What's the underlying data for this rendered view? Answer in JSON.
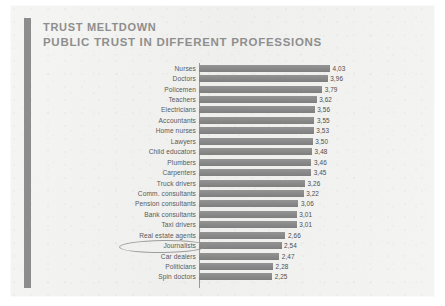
{
  "document": {
    "title_line1": "TRUST MELTDOWN",
    "title_line2": "PUBLIC TRUST IN DIFFERENT PROFESSIONS",
    "accent_color": "#8d8d8d",
    "bar_color": "#8b8b8b",
    "page_background": "#f2f2f0",
    "annotation": {
      "type": "hand-drawn-ellipse",
      "target": "Journalists",
      "color": "#8f8f8f"
    }
  },
  "chart_data": {
    "type": "bar",
    "orientation": "horizontal",
    "xlabel": "",
    "ylabel": "",
    "xlim": [
      0,
      4.03
    ],
    "grid": false,
    "legend": null,
    "decimal_separator": ",",
    "categories": [
      "Nurses",
      "Doctors",
      "Policemen",
      "Teachers",
      "Electricians",
      "Accountants",
      "Home nurses",
      "Lawyers",
      "Child educators",
      "Plumbers",
      "Carpenters",
      "Truck drivers",
      "Comm. consultants",
      "Pension consultants",
      "Bank consultants",
      "Taxi drivers",
      "Real estate agents",
      "Journalists",
      "Car dealers",
      "Politicians",
      "Spin doctors"
    ],
    "values": [
      4.03,
      3.96,
      3.79,
      3.62,
      3.56,
      3.55,
      3.53,
      3.5,
      3.48,
      3.46,
      3.45,
      3.26,
      3.22,
      3.06,
      3.01,
      3.01,
      2.66,
      2.54,
      2.47,
      2.28,
      2.25
    ],
    "value_labels": [
      "4,03",
      "3,96",
      "3,79",
      "3,62",
      "3,56",
      "3,55",
      "3,53",
      "3,50",
      "3,48",
      "3,46",
      "3,45",
      "3,26",
      "3,22",
      "3,06",
      "3,01",
      "3,01",
      "2,66",
      "2,54",
      "2,47",
      "2,28",
      "2,25"
    ],
    "highlighted": [
      "Journalists"
    ]
  }
}
